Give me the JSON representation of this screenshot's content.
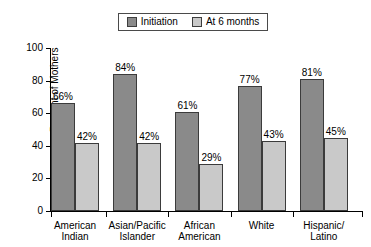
{
  "chart_data": {
    "type": "bar",
    "title": "",
    "xlabel": "",
    "ylabel": "Percent of Mothers",
    "ylim": [
      0,
      100
    ],
    "yticks": [
      0,
      20,
      40,
      60,
      80,
      100
    ],
    "ytick_labels": [
      "0",
      "20",
      "40",
      "60",
      "80",
      "100"
    ],
    "grid": false,
    "legend_position": "top-center",
    "categories": [
      "American\nIndian",
      "Asian/Pacific\nIslander",
      "African\nAmerican",
      "White",
      "Hispanic/\nLatino"
    ],
    "series": [
      {
        "name": "Initiation",
        "color": "#8a8a8a",
        "values": [
          66,
          84,
          61,
          77,
          81
        ],
        "value_labels": [
          "66%",
          "84%",
          "61%",
          "77%",
          "81%"
        ]
      },
      {
        "name": "At 6 months",
        "color": "#c9c9c9",
        "values": [
          42,
          42,
          29,
          43,
          45
        ],
        "value_labels": [
          "42%",
          "42%",
          "29%",
          "43%",
          "45%"
        ]
      }
    ]
  },
  "legend": {
    "entries": [
      {
        "label": "Initiation",
        "color": "#8a8a8a"
      },
      {
        "label": "At 6 months",
        "color": "#c9c9c9"
      }
    ]
  },
  "axis": {
    "y_title": "Percent of Mothers"
  },
  "colors": {
    "series_initiation": "#8a8a8a",
    "series_six_months": "#c9c9c9",
    "bar_outline": "#3b3b3b",
    "axis": "#000000",
    "background": "#ffffff"
  }
}
